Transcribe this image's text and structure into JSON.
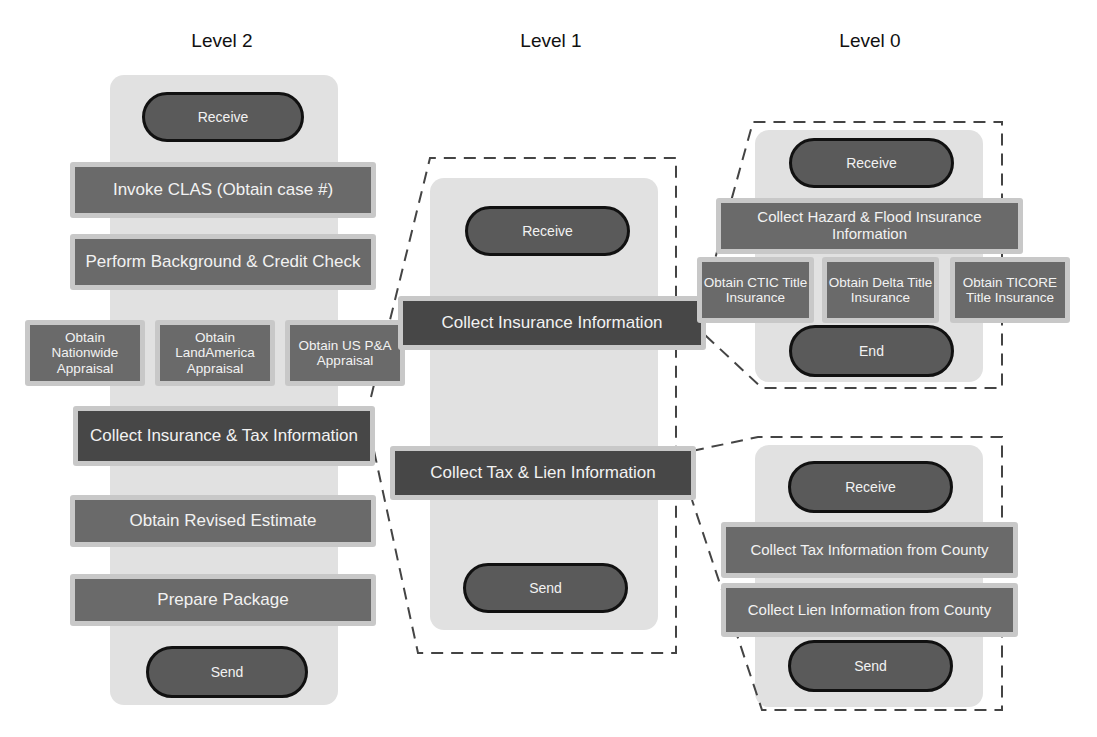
{
  "diagram": {
    "header_fragment": "",
    "levels": [
      {
        "title": "Level 2",
        "start": "Receive",
        "tasks": [
          "Invoke CLAS (Obtain case #)",
          "Perform Background & Credit Check",
          "Obtain Nationwide Appraisal",
          "Obtain LandAmerica Appraisal",
          "Obtain US P&A Appraisal",
          "Collect Insurance & Tax Information",
          "Obtain Revised Estimate",
          "Prepare Package"
        ],
        "end": "Send"
      },
      {
        "title": "Level 1",
        "start": "Receive",
        "tasks": [
          "Collect Insurance Information",
          "Collect Tax & Lien Information"
        ],
        "end": "Send"
      },
      {
        "title": "Level 0",
        "subprocesses": [
          {
            "name": "insurance",
            "start": "Receive",
            "tasks": [
              "Collect Hazard & Flood Insurance Information",
              "Obtain CTIC Title Insurance",
              "Obtain Delta Title Insurance",
              "Obtain TICORE Title Insurance"
            ],
            "end": "End"
          },
          {
            "name": "tax-lien",
            "start": "Receive",
            "tasks": [
              "Collect Tax Information from County",
              "Collect Lien Information from County"
            ],
            "end": "Send"
          }
        ]
      }
    ],
    "colors": {
      "lane_bg": "#e1e1e1",
      "task_fill": "#6a6a6a",
      "task_fill_dark": "#474747",
      "task_border": "#c8c8c8",
      "pill_fill": "#5a5a5a",
      "pill_border": "#111111",
      "text_light": "#f2f2f2",
      "dash": "#444444"
    }
  }
}
